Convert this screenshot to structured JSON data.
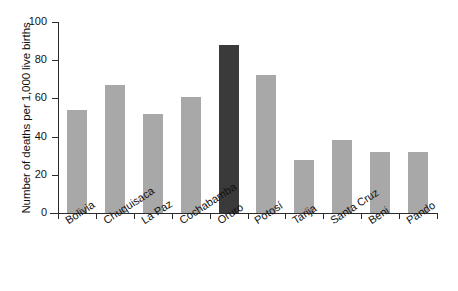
{
  "chart_data": {
    "type": "bar",
    "title": "",
    "subtitle": "",
    "xlabel": "",
    "ylabel": "Number of deaths per 1,000 live births",
    "ylim": [
      0,
      100
    ],
    "yticks": [
      0,
      20,
      40,
      60,
      80,
      100
    ],
    "ytick_labels": [
      "0",
      "20",
      "40",
      "60",
      "80",
      "100"
    ],
    "grid": false,
    "legend": null,
    "categories": [
      "Bolivia",
      "Chuquisaca",
      "La Paz",
      "Cochabamba",
      "Oruro",
      "Potosí",
      "Tarija",
      "Santa Cruz",
      "Beni",
      "Pando"
    ],
    "values": [
      54,
      67,
      52,
      61,
      88,
      72,
      28,
      38,
      32,
      32
    ],
    "highlight_category": "Oruro",
    "colors": {
      "bar": "#a8a8a8",
      "bar_highlight": "#3a3a3a",
      "axis": "#2b2b2b",
      "text": "#111111",
      "background": "#ffffff"
    }
  }
}
